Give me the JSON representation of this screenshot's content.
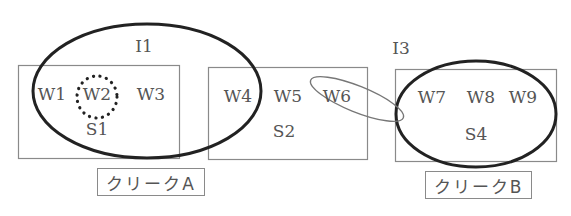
{
  "diagram": {
    "type": "clustering-venn",
    "colors": {
      "box_stroke": "#8a8a8a",
      "ellipse_stroke": "#222222",
      "thin_ellipse_stroke": "#777777",
      "text": "#555555"
    },
    "sets": [
      {
        "id": "S1",
        "label": "S1",
        "words": [
          "W1",
          "W2",
          "W3"
        ]
      },
      {
        "id": "S2",
        "label": "S2",
        "words": [
          "W4",
          "W5",
          "W6"
        ]
      },
      {
        "id": "S4",
        "label": "S4",
        "words": [
          "W7",
          "W8",
          "W9"
        ]
      }
    ],
    "clusters": [
      {
        "id": "I1",
        "label": "I1",
        "style": "thick-ellipse"
      },
      {
        "id": "I3",
        "label": "I3",
        "style": "thick-ellipse"
      },
      {
        "id": "W6-link",
        "label": "",
        "style": "thin-tilted-ellipse"
      },
      {
        "id": "W2-highlight",
        "label": "",
        "style": "dotted-circle"
      }
    ],
    "words": {
      "w1": "W1",
      "w2": "W2",
      "w3": "W3",
      "w4": "W4",
      "w5": "W5",
      "w6": "W6",
      "w7": "W7",
      "w8": "W8",
      "w9": "W9"
    },
    "set_labels": {
      "s1": "S1",
      "s2": "S2",
      "s4": "S4"
    },
    "cluster_labels": {
      "i1": "I1",
      "i3": "I3"
    },
    "captions": {
      "clique_a": "クリークA",
      "clique_b": "クリークB"
    }
  }
}
